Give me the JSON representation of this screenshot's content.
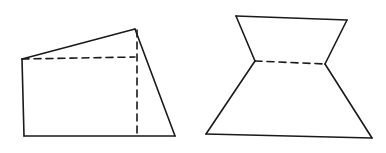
{
  "diagram": {
    "width": 386,
    "height": 153,
    "background": "#ffffff",
    "stroke_color": "#1a1a1a",
    "stroke_width": 1.6,
    "figures": [
      {
        "name": "left-figure",
        "solid_edges": [
          [
            [
              22,
              59
            ],
            [
              135,
              29
            ]
          ],
          [
            [
              135,
              29
            ],
            [
              175,
              136
            ]
          ],
          [
            [
              22,
              59
            ],
            [
              24,
              136
            ]
          ],
          [
            [
              24,
              136
            ],
            [
              175,
              136
            ]
          ]
        ],
        "dashed_edges": [
          [
            [
              22,
              59
            ],
            [
              135,
              57
            ]
          ],
          [
            [
              137,
              30
            ],
            [
              137,
              136
            ]
          ]
        ]
      },
      {
        "name": "right-figure",
        "solid_edges": [
          [
            [
              236,
              16
            ],
            [
              347,
              20
            ]
          ],
          [
            [
              236,
              16
            ],
            [
              255,
              61
            ]
          ],
          [
            [
              347,
              20
            ],
            [
              325,
              64
            ]
          ],
          [
            [
              255,
              61
            ],
            [
              206,
              134
            ]
          ],
          [
            [
              325,
              64
            ],
            [
              372,
              138
            ]
          ],
          [
            [
              206,
              134
            ],
            [
              372,
              138
            ]
          ]
        ],
        "dashed_edges": [
          [
            [
              255,
              61
            ],
            [
              325,
              64
            ]
          ]
        ]
      }
    ]
  }
}
